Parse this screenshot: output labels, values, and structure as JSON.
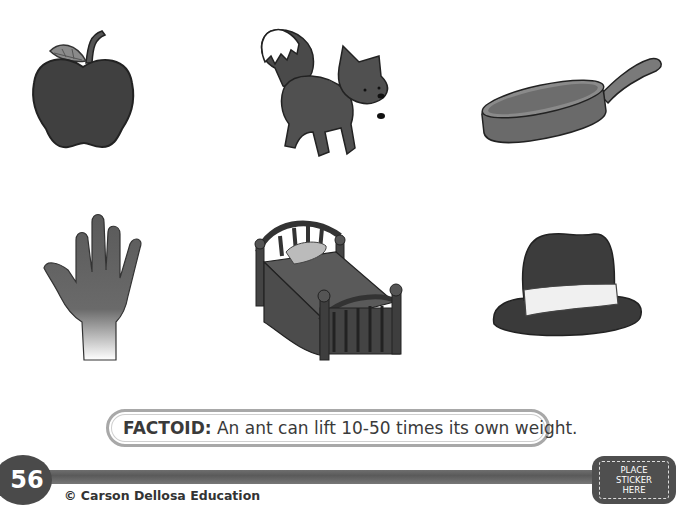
{
  "pictures": [
    {
      "name": "apple",
      "label": "apple"
    },
    {
      "name": "fox",
      "label": "fox"
    },
    {
      "name": "pan",
      "label": "pan"
    },
    {
      "name": "hand",
      "label": "hand"
    },
    {
      "name": "bed",
      "label": "bed"
    },
    {
      "name": "hat",
      "label": "hat"
    }
  ],
  "factoid": {
    "label": "FACTOID:",
    "text": " An ant can lift 10-50 times its own weight."
  },
  "footer": {
    "page_number": "56",
    "copyright": "© Carson Dellosa Education",
    "sticker_lines": [
      "PLACE",
      "STICKER",
      "HERE"
    ]
  }
}
